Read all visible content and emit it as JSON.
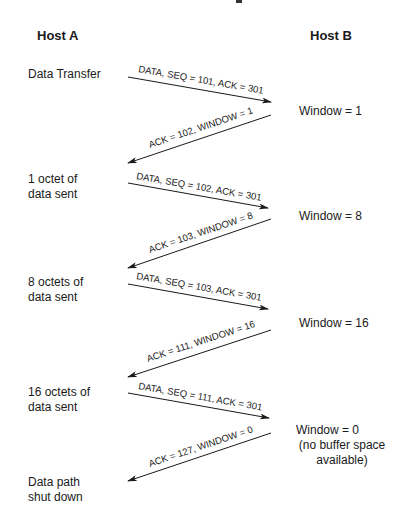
{
  "diagram": {
    "type": "sequence",
    "topic": "TCP window flow control",
    "hosts": [
      {
        "id": "A",
        "label": "Host  A"
      },
      {
        "id": "B",
        "label": "Host  B"
      }
    ],
    "host_a_states": [
      {
        "lines": [
          "Data Transfer"
        ]
      },
      {
        "lines": [
          "1 octet of",
          "data sent"
        ]
      },
      {
        "lines": [
          "8 octets of",
          "data sent"
        ]
      },
      {
        "lines": [
          "16 octets of",
          "data sent"
        ]
      },
      {
        "lines": [
          "Data path",
          "shut down"
        ]
      }
    ],
    "host_b_states": [
      {
        "lines": [
          "Window = 1"
        ]
      },
      {
        "lines": [
          "Window = 8"
        ]
      },
      {
        "lines": [
          "Window = 16"
        ]
      },
      {
        "lines": [
          "Window = 0",
          "(no buffer space",
          "available)"
        ]
      }
    ],
    "messages": [
      {
        "from": "A",
        "to": "B",
        "label": "DATA, SEQ = 101, ACK = 301"
      },
      {
        "from": "B",
        "to": "A",
        "label": "ACK = 102, WINDOW = 1"
      },
      {
        "from": "A",
        "to": "B",
        "label": "DATA, SEQ = 102, ACK =  301"
      },
      {
        "from": "B",
        "to": "A",
        "label": "ACK = 103, WINDOW = 8"
      },
      {
        "from": "A",
        "to": "B",
        "label": "DATA, SEQ = 103, ACK =  301"
      },
      {
        "from": "B",
        "to": "A",
        "label": "ACK = 111, WINDOW = 16"
      },
      {
        "from": "A",
        "to": "B",
        "label": "DATA, SEQ = 111, ACK = 301"
      },
      {
        "from": "B",
        "to": "A",
        "label": "ACK = 127, WINDOW = 0"
      }
    ]
  }
}
